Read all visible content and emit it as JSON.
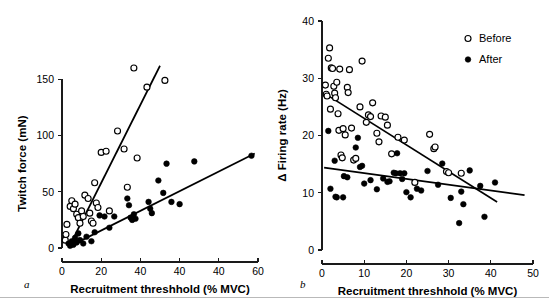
{
  "figure": {
    "background": "#ffffff",
    "ink_color": "#000000",
    "panels": [
      "a",
      "b"
    ]
  },
  "legend": {
    "position": "top-right of panel b",
    "entries": [
      {
        "label": "Before",
        "marker": "open-circle"
      },
      {
        "label": "After",
        "marker": "filled-circle"
      }
    ]
  },
  "chart_data": [
    {
      "panel": "a",
      "type": "scatter",
      "title": "",
      "xlabel": "Recruitment threshhold (% MVC)",
      "ylabel": "Twitch force (mN)",
      "xlim": [
        0,
        60
      ],
      "ylim": [
        0,
        160
      ],
      "grid": false,
      "xticks": [
        0,
        20,
        40,
        40,
        40,
        60
      ],
      "xtick_positions": [
        0,
        12,
        24,
        36,
        48,
        60
      ],
      "yticks": [
        0,
        50,
        100,
        150
      ],
      "legend_position": "none",
      "series": [
        {
          "name": "Before",
          "marker": "open-circle",
          "points": [
            [
              1.0,
              7
            ],
            [
              1.2,
              12
            ],
            [
              1.5,
              21
            ],
            [
              2.5,
              37
            ],
            [
              3.0,
              42
            ],
            [
              3.5,
              35
            ],
            [
              4.0,
              39
            ],
            [
              4.5,
              30
            ],
            [
              5.0,
              27
            ],
            [
              5.5,
              22
            ],
            [
              6.0,
              33
            ],
            [
              6.5,
              28
            ],
            [
              7.0,
              47
            ],
            [
              8.0,
              44
            ],
            [
              8.5,
              31
            ],
            [
              9.0,
              24
            ],
            [
              9.5,
              22
            ],
            [
              10.0,
              58
            ],
            [
              10.5,
              40
            ],
            [
              11.0,
              36
            ],
            [
              12.0,
              85
            ],
            [
              13.5,
              86
            ],
            [
              14.5,
              33
            ],
            [
              17.0,
              104
            ],
            [
              19.0,
              88
            ],
            [
              20.0,
              54
            ],
            [
              22.0,
              160
            ],
            [
              23.0,
              80
            ],
            [
              26.0,
              143
            ],
            [
              31.5,
              149
            ]
          ],
          "fit_line": {
            "x1": 2.0,
            "y1": 0,
            "x2": 30.0,
            "y2": 162
          }
        },
        {
          "name": "After",
          "marker": "filled-circle",
          "points": [
            [
              2.0,
              4
            ],
            [
              2.5,
              2
            ],
            [
              3.0,
              6
            ],
            [
              3.5,
              3
            ],
            [
              4.0,
              9
            ],
            [
              4.5,
              5
            ],
            [
              5.0,
              13
            ],
            [
              5.5,
              7
            ],
            [
              6.5,
              4
            ],
            [
              7.5,
              10
            ],
            [
              9.0,
              6
            ],
            [
              10.0,
              14
            ],
            [
              11.5,
              29
            ],
            [
              13.0,
              28
            ],
            [
              14.5,
              18
            ],
            [
              16.0,
              28
            ],
            [
              20.0,
              44
            ],
            [
              20.5,
              38
            ],
            [
              21.0,
              27
            ],
            [
              21.5,
              25
            ],
            [
              22.0,
              30
            ],
            [
              22.5,
              26
            ],
            [
              26.5,
              41
            ],
            [
              27.0,
              35
            ],
            [
              27.5,
              31
            ],
            [
              29.5,
              60
            ],
            [
              31.0,
              49
            ],
            [
              32.0,
              75
            ],
            [
              33.5,
              41
            ],
            [
              36.0,
              39
            ],
            [
              40.5,
              77
            ],
            [
              58.0,
              82
            ]
          ],
          "fit_line": {
            "x1": 2.0,
            "y1": 1,
            "x2": 59.0,
            "y2": 84
          }
        }
      ]
    },
    {
      "panel": "b",
      "type": "scatter",
      "title": "",
      "xlabel": "Recruitment threshhold (% MVC)",
      "ylabel": "Δ Firing rate (Hz)",
      "xlim": [
        0,
        50
      ],
      "ylim": [
        0,
        40
      ],
      "grid": false,
      "xticks": [
        0,
        10,
        20,
        30,
        40,
        50
      ],
      "yticks": [
        0,
        10,
        20,
        30,
        40
      ],
      "legend_position": "top-right",
      "series": [
        {
          "name": "Before",
          "marker": "open-circle",
          "points": [
            [
              0.8,
              28.8
            ],
            [
              1.0,
              27.2
            ],
            [
              1.2,
              26.9
            ],
            [
              1.5,
              33.5
            ],
            [
              1.8,
              35.3
            ],
            [
              2.0,
              24.6
            ],
            [
              2.2,
              31.8
            ],
            [
              2.5,
              31.7
            ],
            [
              2.8,
              28.6
            ],
            [
              3.0,
              27.4
            ],
            [
              3.2,
              26.6
            ],
            [
              3.5,
              29.3
            ],
            [
              3.8,
              23.8
            ],
            [
              4.0,
              20.9
            ],
            [
              4.2,
              31.6
            ],
            [
              4.5,
              16.6
            ],
            [
              4.8,
              16.1
            ],
            [
              5.0,
              21.2
            ],
            [
              5.5,
              20.1
            ],
            [
              6.0,
              28.4
            ],
            [
              6.2,
              27.5
            ],
            [
              6.5,
              31.5
            ],
            [
              7.0,
              21.3
            ],
            [
              7.5,
              15.7
            ],
            [
              8.0,
              16.0
            ],
            [
              9.0,
              25.0
            ],
            [
              9.5,
              33.0
            ],
            [
              10.5,
              22.3
            ],
            [
              11.0,
              23.6
            ],
            [
              11.5,
              23.3
            ],
            [
              12.0,
              25.7
            ],
            [
              13.0,
              20.4
            ],
            [
              13.5,
              18.9
            ],
            [
              14.0,
              23.4
            ],
            [
              15.0,
              23.2
            ],
            [
              15.5,
              21.8
            ],
            [
              16.5,
              16.8
            ],
            [
              18.0,
              19.7
            ],
            [
              19.5,
              19.2
            ],
            [
              22.0,
              11.8
            ],
            [
              25.5,
              20.2
            ],
            [
              26.5,
              17.7
            ],
            [
              26.8,
              18.0
            ],
            [
              29.5,
              13.7
            ],
            [
              30.0,
              13.5
            ],
            [
              33.0,
              13.4
            ]
          ],
          "fit_line": {
            "x1": 0.5,
            "y1": 27.4,
            "x2": 41.5,
            "y2": 8.4
          }
        },
        {
          "name": "After",
          "marker": "filled-circle",
          "points": [
            [
              1.5,
              20.8
            ],
            [
              2.0,
              10.7
            ],
            [
              3.0,
              15.6
            ],
            [
              3.2,
              9.3
            ],
            [
              3.5,
              9.2
            ],
            [
              5.0,
              9.2
            ],
            [
              5.2,
              12.9
            ],
            [
              6.0,
              12.7
            ],
            [
              8.0,
              17.9
            ],
            [
              8.5,
              19.6
            ],
            [
              9.0,
              14.5
            ],
            [
              9.5,
              14.7
            ],
            [
              10.0,
              11.6
            ],
            [
              11.5,
              12.2
            ],
            [
              13.0,
              10.6
            ],
            [
              14.5,
              12.5
            ],
            [
              15.5,
              11.9
            ],
            [
              16.0,
              12.0
            ],
            [
              17.0,
              13.5
            ],
            [
              17.5,
              13.4
            ],
            [
              17.8,
              16.9
            ],
            [
              18.5,
              13.4
            ],
            [
              19.0,
              12.4
            ],
            [
              19.5,
              13.4
            ],
            [
              20.0,
              10.1
            ],
            [
              21.0,
              9.2
            ],
            [
              22.5,
              10.7
            ],
            [
              23.5,
              10.4
            ],
            [
              25.0,
              13.8
            ],
            [
              27.5,
              11.4
            ],
            [
              28.5,
              15.1
            ],
            [
              30.5,
              9.1
            ],
            [
              32.5,
              4.7
            ],
            [
              33.0,
              10.2
            ],
            [
              33.5,
              8.0
            ],
            [
              35.0,
              13.9
            ],
            [
              37.5,
              11.2
            ],
            [
              38.5,
              5.8
            ],
            [
              41.0,
              11.8
            ]
          ],
          "fit_line": {
            "x1": 0.5,
            "y1": 14.4,
            "x2": 48.0,
            "y2": 9.6
          }
        }
      ]
    }
  ]
}
